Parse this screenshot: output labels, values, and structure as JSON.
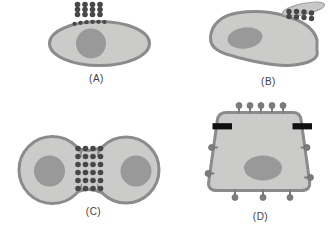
{
  "figure": {
    "panels": [
      {
        "id": "A",
        "label": "(A)"
      },
      {
        "id": "B",
        "label": "(B)"
      },
      {
        "id": "C",
        "label": "(C)"
      },
      {
        "id": "D",
        "label": "(D)"
      }
    ],
    "colors": {
      "background": "#ffffff",
      "cytoplasm": "#cbcbca",
      "membrane": "#8b8b8b",
      "nucleus": "#999999",
      "bead": "#474747",
      "particle_disc": "#c8c8c8",
      "particle_disc_edge": "#a5a5a5",
      "junction_bar": "#101010",
      "surface_knob": "#7d7d7d",
      "label_text": "#3e3e3e"
    }
  }
}
